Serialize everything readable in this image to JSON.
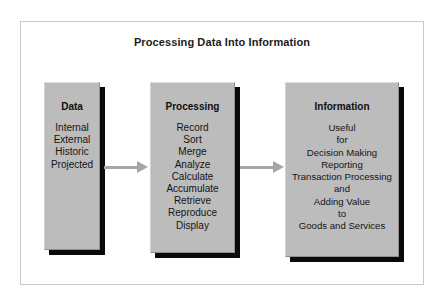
{
  "diagram": {
    "title": "Processing Data Into Information",
    "colors": {
      "box_fill": "#bcbcbc",
      "box_shadow": "#0a0a0a",
      "arrow": "#a6a6a6",
      "frame_border": "#c9c9c9",
      "background": "#ffffff",
      "text": "#141414"
    },
    "boxes": [
      {
        "heading": "Data",
        "items": [
          "Internal",
          "External",
          "Historic",
          "Projected"
        ]
      },
      {
        "heading": "Processing",
        "items": [
          "Record",
          "Sort",
          "Merge",
          "Analyze",
          "Calculate",
          "Accumulate",
          "Retrieve",
          "Reproduce",
          "Display"
        ]
      },
      {
        "heading": "Information",
        "items": [
          "Useful",
          "for",
          "Decision Making",
          "Reporting",
          "Transaction Processing",
          "and",
          "Adding Value",
          "to",
          "Goods and Services"
        ]
      }
    ],
    "arrows": [
      {
        "name": "arrow-data-to-processing",
        "direction": "right"
      },
      {
        "name": "arrow-processing-to-information",
        "direction": "right"
      }
    ]
  }
}
